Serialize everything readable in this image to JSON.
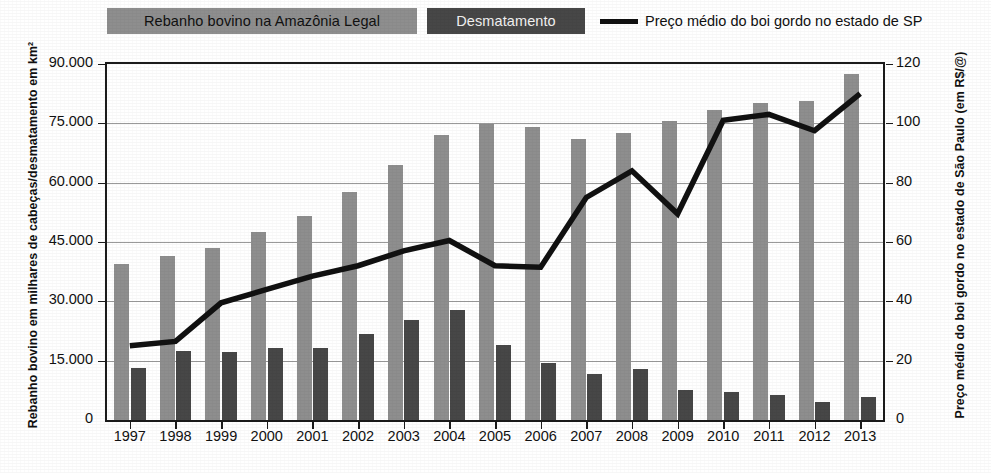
{
  "legend": {
    "herd_label": "Rebanho bovino na Amazônia Legal",
    "deforestation_label": "Desmatamento",
    "price_label": "Preço médio do boi gordo no estado de SP"
  },
  "axes": {
    "y_left_title": "Rebanho bovino em milhares de cabeças/desmatamento em km²",
    "y_right_title": "Preço médio do boi gordo no estado de São Paulo (em R$/@)",
    "y_left_ticks": [
      "0",
      "15.000",
      "30.000",
      "45.000",
      "60.000",
      "75.000",
      "90.000"
    ],
    "y_right_ticks": [
      "0",
      "20",
      "40",
      "60",
      "80",
      "100",
      "120"
    ],
    "x_ticks": [
      "1997",
      "1998",
      "1999",
      "2000",
      "2001",
      "2002",
      "2003",
      "2004",
      "2005",
      "2006",
      "2007",
      "2008",
      "2009",
      "2010",
      "2011",
      "2012",
      "2013"
    ]
  },
  "caption": "",
  "colors": {
    "herd_bar": "#8e8e8e",
    "deforestation_bar": "#474747",
    "price_line": "#111111",
    "gridline": "#9a9a9a",
    "frame": "#1b1b1b",
    "background": "#ffffff"
  },
  "chart_data": {
    "type": "bar",
    "title": "",
    "subtitle": "",
    "xlabel": "",
    "ylabel": "Rebanho bovino em milhares de cabeças/desmatamento em km²",
    "y2label": "Preço médio do boi gordo no estado de São Paulo (em R$/@)",
    "categories": [
      "1997",
      "1998",
      "1999",
      "2000",
      "2001",
      "2002",
      "2003",
      "2004",
      "2005",
      "2006",
      "2007",
      "2008",
      "2009",
      "2010",
      "2011",
      "2012",
      "2013"
    ],
    "ylim": [
      0,
      90000
    ],
    "y2lim": [
      0,
      120
    ],
    "yticks": [
      0,
      15000,
      30000,
      45000,
      60000,
      75000,
      90000
    ],
    "y2ticks": [
      0,
      20,
      40,
      60,
      80,
      100,
      120
    ],
    "grid": true,
    "legend_position": "top",
    "series": [
      {
        "name": "Rebanho bovino na Amazônia Legal",
        "type": "bar",
        "axis": "left",
        "unit": "milhares de cabeças",
        "color": "#8e8e8e",
        "values": [
          39500,
          41500,
          43500,
          47500,
          51700,
          57600,
          64500,
          72000,
          74800,
          74200,
          71000,
          72600,
          75500,
          78500,
          80200,
          80600,
          87500
        ]
      },
      {
        "name": "Desmatamento",
        "type": "bar",
        "axis": "left",
        "unit": "km²",
        "color": "#474747",
        "values": [
          13200,
          17400,
          17300,
          18200,
          18200,
          21700,
          25400,
          27800,
          19000,
          14300,
          11650,
          12900,
          7500,
          7000,
          6400,
          4600,
          5900
        ]
      },
      {
        "name": "Preço médio do boi gordo no estado de SP",
        "type": "line",
        "axis": "right",
        "unit": "R$/@",
        "color": "#111111",
        "values": [
          25,
          26.5,
          39.5,
          44,
          48.5,
          52,
          57,
          60.5,
          52,
          51.5,
          75,
          84,
          69.5,
          101,
          103,
          97.5,
          110
        ]
      }
    ]
  }
}
